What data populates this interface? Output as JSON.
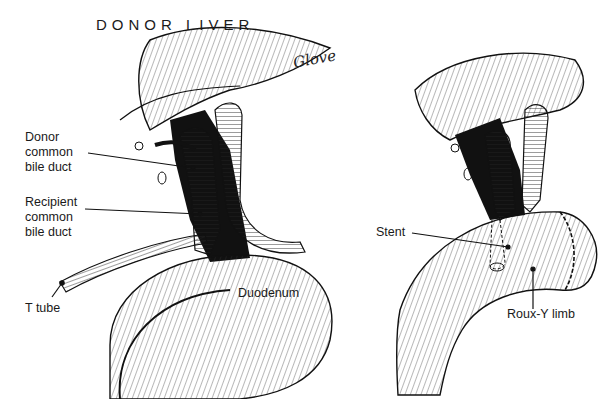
{
  "figure": {
    "title": "DONOR LIVER",
    "signature": "Glove",
    "left_panel": {
      "labels": [
        {
          "id": "donor_cbd",
          "text": "Donor\ncommon\nbile duct"
        },
        {
          "id": "recipient_cbd",
          "text": "Recipient\ncommon\nbile duct"
        },
        {
          "id": "t_tube",
          "text": "T tube"
        },
        {
          "id": "duodenum",
          "text": "Duodenum"
        }
      ]
    },
    "right_panel": {
      "labels": [
        {
          "id": "stent",
          "text": "Stent"
        },
        {
          "id": "roux_y",
          "text": "Roux-Y limb"
        }
      ]
    }
  },
  "colors": {
    "ink": "#111111",
    "background": "#ffffff"
  }
}
